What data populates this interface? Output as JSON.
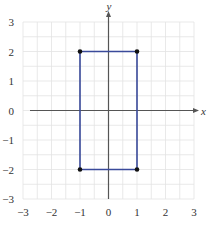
{
  "chart_data": {
    "type": "line",
    "title": "",
    "xlabel": "x",
    "ylabel": "y",
    "xlim": [
      -3,
      3
    ],
    "ylim": [
      -3,
      3
    ],
    "grid": true,
    "minor_grid_step": 0.5,
    "x_ticks": [
      -3,
      -2,
      -1,
      0,
      1,
      2,
      3
    ],
    "y_ticks": [
      -3,
      -2,
      -1,
      0,
      1,
      2,
      3
    ],
    "x_tick_labels": [
      "−3",
      "−2",
      "−1",
      "0",
      "1",
      "2",
      "3"
    ],
    "y_tick_labels": [
      "−3",
      "−2",
      "−1",
      "0",
      "1",
      "2",
      "3"
    ],
    "series": [
      {
        "name": "rectangle",
        "closed": true,
        "color": "#3a4a9a",
        "points": [
          {
            "x": -1,
            "y": 2
          },
          {
            "x": 1,
            "y": 2
          },
          {
            "x": 1,
            "y": -2
          },
          {
            "x": -1,
            "y": -2
          }
        ]
      }
    ],
    "vertex_marker_color": "#111111"
  },
  "colors": {
    "grid": "#e3e3e3",
    "axis": "#555555",
    "shape": "#3a4a9a",
    "vertex": "#111111"
  }
}
